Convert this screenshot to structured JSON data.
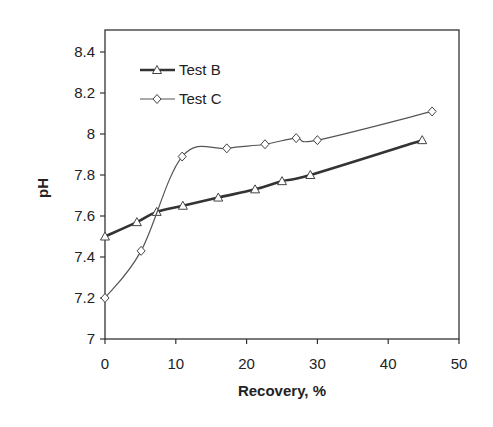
{
  "chart_data": {
    "type": "line",
    "title": "",
    "xlabel": "Recovery, %",
    "ylabel": "pH",
    "xlim": [
      0,
      50
    ],
    "ylim": [
      7,
      8.4
    ],
    "xticks": [
      0,
      10,
      20,
      30,
      40,
      50
    ],
    "yticks": [
      7,
      7.2,
      7.4,
      7.6,
      7.8,
      8,
      8.2,
      8.4
    ],
    "ytick_labels": [
      "7",
      "7.2",
      "7.4",
      "7.6",
      "7.8",
      "8",
      "8.2",
      "8.4"
    ],
    "grid": false,
    "legend_position": "upper-left-inside",
    "series": [
      {
        "name": "Test B",
        "marker": "triangle",
        "line_width": 2.6,
        "color": "#333333",
        "x": [
          0,
          4.5,
          7.3,
          11,
          16,
          21.2,
          25,
          29,
          44.8
        ],
        "y": [
          7.5,
          7.57,
          7.62,
          7.65,
          7.69,
          7.73,
          7.77,
          7.8,
          7.97
        ]
      },
      {
        "name": "Test C",
        "marker": "diamond",
        "line_width": 1.2,
        "color": "#555555",
        "x": [
          0,
          5.1,
          10.9,
          17.2,
          22.6,
          27,
          30,
          46.2
        ],
        "y": [
          7.2,
          7.43,
          7.89,
          7.93,
          7.95,
          7.98,
          7.97,
          8.11
        ]
      }
    ]
  }
}
